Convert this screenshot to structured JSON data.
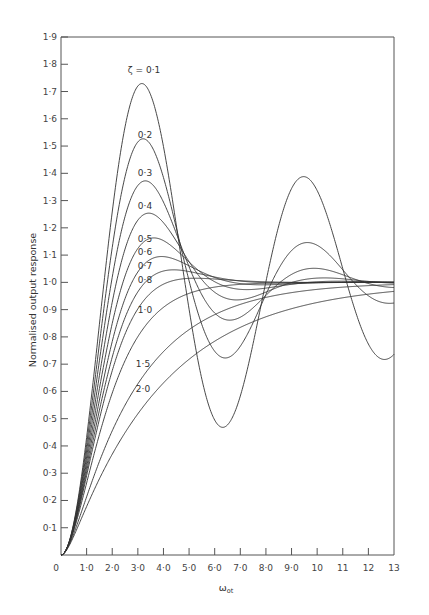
{
  "chart_data": {
    "type": "line",
    "title": "",
    "xlabel": "ω₀t",
    "ylabel": "Normalised output response",
    "xlim": [
      0,
      13
    ],
    "ylim": [
      0,
      1.9
    ],
    "grid": false,
    "legend": "inline curve labels",
    "x_ticks": [
      "0",
      "1·0",
      "2·0",
      "3·0",
      "4·0",
      "5·0",
      "6·0",
      "7·0",
      "8·0",
      "9·0",
      "10",
      "11",
      "12",
      "13"
    ],
    "y_ticks": [
      "0·1",
      "0·2",
      "0·3",
      "0·4",
      "0·5",
      "0·6",
      "0·7",
      "0·8",
      "0·9",
      "1·0",
      "1·1",
      "1·2",
      "1·3",
      "1·4",
      "1·5",
      "1·6",
      "1·7",
      "1·8",
      "1·9"
    ],
    "series": [
      {
        "name": "ζ = 0·1",
        "label": "ζ = 0·1",
        "zeta": 0.1,
        "peak": [
          3.16,
          1.73
        ],
        "trough": [
          6.3,
          0.53
        ],
        "label_pos": [
          3.0,
          1.78
        ]
      },
      {
        "name": "0·2",
        "label": "0·2",
        "zeta": 0.2,
        "peak": [
          3.2,
          1.53
        ],
        "label_pos": [
          3.0,
          1.54
        ]
      },
      {
        "name": "0·3",
        "label": "0·3",
        "zeta": 0.3,
        "peak": [
          3.3,
          1.37
        ],
        "label_pos": [
          3.0,
          1.4
        ]
      },
      {
        "name": "0·4",
        "label": "0·4",
        "zeta": 0.4,
        "peak": [
          3.4,
          1.25
        ],
        "label_pos": [
          3.0,
          1.28
        ]
      },
      {
        "name": "0·5",
        "label": "0·5",
        "zeta": 0.5,
        "peak": [
          3.6,
          1.16
        ],
        "label_pos": [
          3.0,
          1.16
        ]
      },
      {
        "name": "0·6",
        "label": "0·6",
        "zeta": 0.6,
        "peak": [
          3.9,
          1.09
        ],
        "label_pos": [
          3.0,
          1.11
        ]
      },
      {
        "name": "0·7",
        "label": "0·7",
        "zeta": 0.7,
        "peak": [
          4.4,
          1.05
        ],
        "label_pos": [
          3.0,
          1.06
        ]
      },
      {
        "name": "0·8",
        "label": "0·8",
        "zeta": 0.8,
        "peak": [
          5.2,
          1.02
        ],
        "label_pos": [
          3.0,
          1.01
        ]
      },
      {
        "name": "1·0",
        "label": "1·0",
        "zeta": 1.0,
        "label_pos": [
          3.0,
          0.9
        ]
      },
      {
        "name": "1·5",
        "label": "1·5",
        "zeta": 1.5,
        "label_pos": [
          3.0,
          0.7
        ]
      },
      {
        "name": "2·0",
        "label": "2·0",
        "zeta": 2.0,
        "label_pos": [
          3.0,
          0.61
        ]
      }
    ]
  },
  "plot": {
    "x_axis_title": "ω",
    "x_axis_subscript": "ot",
    "y_axis_title": "Normalised output response"
  }
}
